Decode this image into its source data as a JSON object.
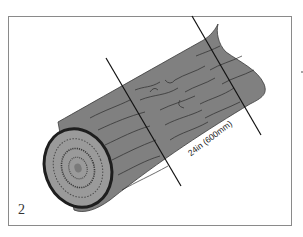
{
  "illustration": {
    "subject": "log with two cut lines",
    "figure_number": "2",
    "measurement_label": "24in (600mm)",
    "colors": {
      "bark": "#808080",
      "end_face": "#9a9a9a",
      "outline": "#1e1e1e",
      "frame": "#8a8a8a",
      "background": "#ffffff"
    }
  }
}
